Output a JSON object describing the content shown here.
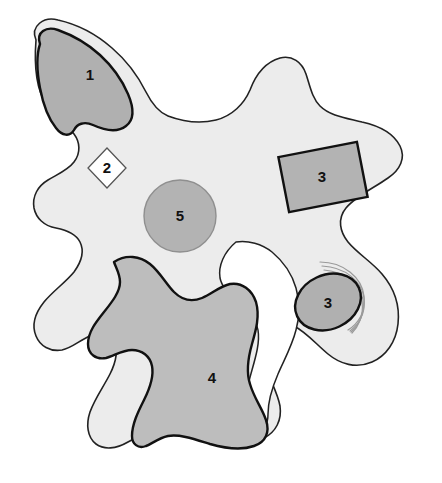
{
  "figure": {
    "kind": "schematic-outline-diagram",
    "width": 442,
    "height": 483,
    "background_color": "#ffffff"
  },
  "palette": {
    "background": "#ffffff",
    "outer_body_fill": "#ececec",
    "outer_body_stroke": "#222222",
    "region_dark_fill": "#b0b0b0",
    "region_mid_fill": "#bdbdbd",
    "region_circle_fill": "#b3b3b3",
    "region_circle_stroke": "#8f8f8f",
    "region_white_fill": "#ffffff",
    "region_outline_strong": "#111111",
    "arc_stroke": "#9a9a9a",
    "label_color": "#111111"
  },
  "regions": [
    {
      "id": "region-1",
      "label": "1",
      "shape": "blob",
      "fill": "#b0b0b0",
      "stroke": "#111111",
      "stroke_width": 2.4,
      "label_x": 90,
      "label_y": 76
    },
    {
      "id": "region-2",
      "label": "2",
      "shape": "diamond",
      "fill": "#ffffff",
      "stroke": "#555555",
      "stroke_width": 1.3,
      "label_x": 107,
      "label_y": 168
    },
    {
      "id": "region-3-rect",
      "label": "3",
      "shape": "rectangle",
      "fill": "#b3b3b3",
      "stroke": "#111111",
      "stroke_width": 2.4,
      "rotation_deg": -11,
      "label_x": 322,
      "label_y": 177
    },
    {
      "id": "region-3-ellipse",
      "label": "3",
      "shape": "ellipse",
      "fill": "#b0b0b0",
      "stroke": "#111111",
      "stroke_width": 2.4,
      "rotation_deg": -25,
      "label_x": 328,
      "label_y": 303
    },
    {
      "id": "region-4",
      "label": "4",
      "shape": "blob",
      "fill": "#bdbdbd",
      "stroke": "#111111",
      "stroke_width": 2.4,
      "label_x": 212,
      "label_y": 379
    },
    {
      "id": "region-5",
      "label": "5",
      "shape": "circle",
      "fill": "#b3b3b3",
      "stroke": "#8f8f8f",
      "stroke_width": 1.4,
      "center_x": 180,
      "center_y": 216,
      "radius": 36,
      "label_x": 180,
      "label_y": 217
    }
  ],
  "decorations": {
    "arc_group": {
      "name": "concentric-arcs",
      "count": 4,
      "stroke": "#9a9a9a",
      "stroke_width": 1.2,
      "attached_to": "region-3-ellipse"
    }
  }
}
